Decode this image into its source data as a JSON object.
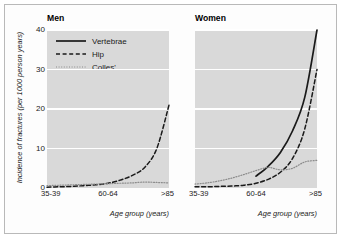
{
  "chart_data": {
    "type": "line",
    "title": "",
    "xlabel": "Age group (years)",
    "ylabel": "Incidence of fractures (per 1000 person years)",
    "ylim": [
      0,
      40
    ],
    "yticks": [
      0,
      10,
      20,
      30,
      40
    ],
    "grid": "horizontal-white",
    "legend_position": "top-left-inside-men-panel",
    "panels": [
      {
        "name": "men",
        "title": "Men",
        "xticks": [
          "35-39",
          "60-64",
          ">85"
        ],
        "categories": [
          "35-39",
          "40-44",
          "45-49",
          "50-54",
          "55-59",
          "60-64",
          "65-69",
          "70-74",
          "75-79",
          "80-84",
          ">85"
        ],
        "series": [
          {
            "name": "Vertebrae",
            "style": "solid",
            "color": "#1a1a1a",
            "values": [
              null,
              null,
              null,
              null,
              null,
              null,
              null,
              null,
              null,
              null,
              null
            ]
          },
          {
            "name": "Hip",
            "style": "dashed",
            "color": "#1a1a1a",
            "values": [
              0.2,
              0.3,
              0.4,
              0.6,
              0.8,
              1.2,
              2.0,
              3.2,
              5.2,
              10.0,
              21.0
            ]
          },
          {
            "name": "Colles'",
            "style": "dotted",
            "color": "#8c8c8c",
            "values": [
              0.6,
              0.7,
              0.8,
              0.9,
              1.0,
              1.1,
              1.2,
              1.3,
              1.5,
              1.4,
              1.3
            ]
          }
        ]
      },
      {
        "name": "women",
        "title": "Women",
        "xticks": [
          "35-39",
          "60-64",
          ">85"
        ],
        "categories": [
          "35-39",
          "40-44",
          "45-49",
          "50-54",
          "55-59",
          "60-64",
          "65-69",
          "70-74",
          "75-79",
          "80-84",
          ">85"
        ],
        "series": [
          {
            "name": "Vertebrae",
            "style": "solid",
            "color": "#1a1a1a",
            "values": [
              null,
              null,
              null,
              null,
              null,
              3.0,
              5.5,
              9.0,
              14.5,
              23.0,
              40.0
            ]
          },
          {
            "name": "Hip",
            "style": "dashed",
            "color": "#1a1a1a",
            "values": [
              0.3,
              0.3,
              0.4,
              0.5,
              0.7,
              1.2,
              2.2,
              4.0,
              7.5,
              15.0,
              30.0
            ]
          },
          {
            "name": "Colles'",
            "style": "dotted",
            "color": "#8c8c8c",
            "values": [
              1.0,
              1.3,
              1.8,
              2.5,
              3.4,
              4.4,
              5.2,
              4.6,
              5.0,
              6.6,
              7.0
            ]
          }
        ]
      }
    ],
    "legend": [
      {
        "label": "Vertebrae",
        "style": "solid",
        "color": "#1a1a1a"
      },
      {
        "label": "Hip",
        "style": "dashed",
        "color": "#1a1a1a"
      },
      {
        "label": "Colles'",
        "style": "dotted",
        "color": "#8c8c8c"
      }
    ],
    "colors": {
      "plot_background": "#d9d9d9",
      "gridline": "#ffffff",
      "figure_background": "#fdfdfd",
      "frame_border": "#b9b9b9",
      "text": "#1a1a1a"
    }
  }
}
